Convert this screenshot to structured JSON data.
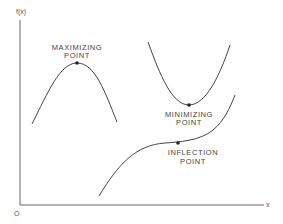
{
  "axes": {
    "y_label": "f(x)",
    "x_label": "x",
    "origin_label": "O"
  },
  "labels": {
    "maximizing": {
      "line1": "MAXIMIZING",
      "line2": "POINT"
    },
    "minimizing": {
      "line1": "MINIMIZING",
      "line2": "POINT"
    },
    "inflection": {
      "line1": "INFLECTION",
      "line2": "POINT"
    }
  },
  "colors": {
    "curve": "#444444",
    "axis": "#666666",
    "text": "#444444",
    "background": "#ffffff"
  }
}
